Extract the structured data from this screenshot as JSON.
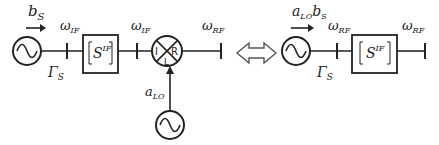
{
  "left_circuit": {
    "source_wave_label": "b",
    "source_wave_sub": "S",
    "reflection_label": "Γ",
    "reflection_sub": "S",
    "freq1_label": "ω",
    "freq1_sub": "IF",
    "block_label": "S",
    "block_sup": "IF",
    "freq2_label": "ω",
    "freq2_sub": "IF",
    "mixer_ports": {
      "left": "I",
      "right": "R",
      "bottom": "L"
    },
    "freq3_label": "ω",
    "freq3_sub": "RF",
    "lo_label": "a",
    "lo_sub": "LO"
  },
  "equivalence_symbol": "double-arrow",
  "right_circuit": {
    "source_wave_label_a": "a",
    "source_wave_sub_a": "LO",
    "source_wave_label_b": "b",
    "source_wave_sub_b": "S",
    "reflection_label": "Γ",
    "reflection_sub": "S",
    "freq1_label": "ω",
    "freq1_sub": "RF",
    "block_label": "S",
    "block_sup": "IF",
    "freq2_label": "ω",
    "freq2_sub": "RF"
  }
}
